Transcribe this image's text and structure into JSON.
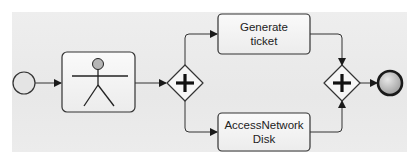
{
  "diagram": {
    "type": "BPMN process",
    "start_event": {
      "label": ""
    },
    "user_task": {
      "icon": "user-actor-icon",
      "label": ""
    },
    "split_gateway": {
      "kind": "parallel",
      "symbol": "+"
    },
    "tasks": [
      {
        "label_line1": "Generate",
        "label_line2": "ticket"
      },
      {
        "label_line1": "AccessNetwork",
        "label_line2": "Disk"
      }
    ],
    "join_gateway": {
      "kind": "parallel",
      "symbol": "+"
    },
    "end_event": {
      "label": ""
    },
    "colors": {
      "stroke": "#2a2a2a",
      "task_fill": "#f4f4f4",
      "background": "#ebebeb",
      "end_fill": "#b8b8b8"
    }
  }
}
